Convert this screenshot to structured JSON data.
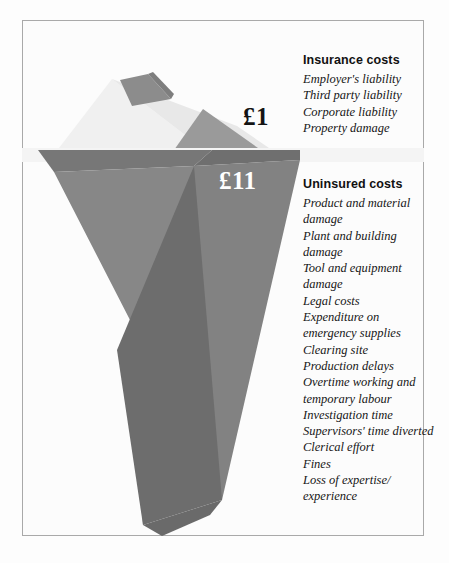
{
  "figure": {
    "title_alt": "Iceberg diagram of insured versus uninsured accident costs",
    "colors": {
      "frame_border": "#a9a9a9",
      "page_background": "#fcfcfc",
      "tip_light": "#f2f2f2",
      "tip_mid": "#dcdcdc",
      "tip_dark_facet": "#8f8f8f",
      "tip_right_facet": "#9b9b9b",
      "water_band": "#f4f4f4",
      "body_light": "#848484",
      "body_dark": "#6e6e6e",
      "body_mid": "#7b7b7b",
      "price_insured_text": "#141414",
      "price_uninsured_text": "#ffffff"
    }
  },
  "prices": {
    "insured": "£1",
    "uninsured": "£11"
  },
  "insurance": {
    "heading": "Insurance costs",
    "items": [
      "Employer's liability",
      "Third party liability",
      "Corporate liability",
      "Property damage"
    ]
  },
  "uninsured": {
    "heading": "Uninsured costs",
    "items": [
      "Product and material damage",
      "Plant and building damage",
      "Tool and equipment damage",
      "Legal costs",
      "Expenditure on emergency supplies",
      "Clearing site",
      "Production delays",
      "Overtime working and temporary labour",
      "Investigation time",
      "Supervisors' time diverted",
      "Clerical effort",
      "Fines",
      "Loss of expertise/ experience"
    ]
  }
}
